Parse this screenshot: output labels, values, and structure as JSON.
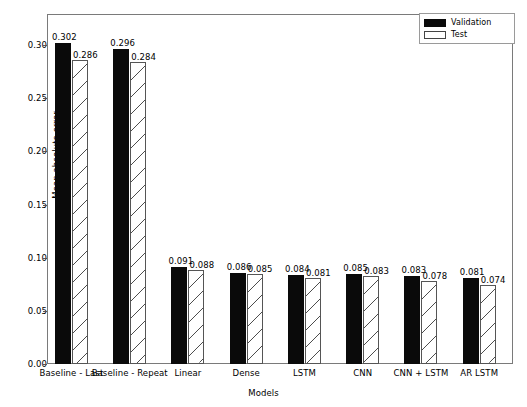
{
  "chart_data": {
    "type": "bar",
    "title": "",
    "xlabel": "Models",
    "ylabel": "Mean absolute error",
    "categories": [
      "Baseline - Last",
      "Baseline - Repeat",
      "Linear",
      "Dense",
      "LSTM",
      "CNN",
      "CNN + LSTM",
      "AR LSTM"
    ],
    "series": [
      {
        "name": "Validation",
        "values": [
          0.302,
          0.296,
          0.091,
          0.086,
          0.084,
          0.085,
          0.083,
          0.081
        ],
        "labels": [
          "0.302",
          "0.296",
          "0.091",
          "0.086",
          "0.084",
          "0.085",
          "0.083",
          "0.081"
        ],
        "color": "#0a0a0a",
        "fill": "solid"
      },
      {
        "name": "Test",
        "values": [
          0.286,
          0.284,
          0.088,
          0.085,
          0.081,
          0.083,
          0.078,
          0.074
        ],
        "labels": [
          "0.286",
          "0.284",
          "0.088",
          "0.085",
          "0.081",
          "0.083",
          "0.078",
          "0.074"
        ],
        "color": "#ffffff",
        "fill": "hatched-diagonal"
      }
    ],
    "ylim": [
      0.0,
      0.33
    ],
    "yticks": [
      0.0,
      0.05,
      0.1,
      0.15,
      0.2,
      0.25,
      0.3
    ],
    "ytick_labels": [
      "0.00",
      "0.05",
      "0.10",
      "0.15",
      "0.20",
      "0.25",
      "0.30"
    ],
    "grid": false,
    "legend_position": "top-right"
  },
  "legend": {
    "entries": [
      {
        "label": "Validation",
        "swatch": "solid-black-rect"
      },
      {
        "label": "Test",
        "swatch": "hatched-white-rect"
      }
    ]
  }
}
